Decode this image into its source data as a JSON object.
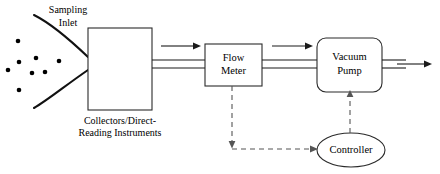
{
  "diagram": {
    "background_color": "#ffffff",
    "line_color": "#1a1a1a",
    "dashed_line_color": "#555555",
    "labels": {
      "sampling_inlet_line1": "Sampling",
      "sampling_inlet_line2": "Inlet",
      "collectors_line1": "Collectors/Direct-",
      "collectors_line2": "Reading Instruments",
      "flow_meter_line1": "Flow",
      "flow_meter_line2": "Meter",
      "vacuum_pump_line1": "Vacuum",
      "vacuum_pump_line2": "Pump",
      "controller": "Controller"
    },
    "nodes": [
      {
        "name": "collectors-box",
        "shape": "rectangle",
        "x": 88,
        "y": 28,
        "width": 64,
        "height": 82
      },
      {
        "name": "flow-meter-box",
        "shape": "rectangle",
        "x": 205,
        "y": 44,
        "width": 57,
        "height": 42
      },
      {
        "name": "vacuum-pump-box",
        "shape": "rounded-rectangle",
        "x": 317,
        "y": 38,
        "width": 65,
        "height": 54,
        "radius": 9
      },
      {
        "name": "controller-ellipse",
        "shape": "ellipse",
        "cx": 351,
        "cy": 150,
        "rx": 34,
        "ry": 17
      }
    ],
    "particles": [
      {
        "cx": 18,
        "cy": 41,
        "r": 2.3
      },
      {
        "cx": 19,
        "cy": 62,
        "r": 2.3
      },
      {
        "cx": 36,
        "cy": 58,
        "r": 2.3
      },
      {
        "cx": 59,
        "cy": 61,
        "r": 2.3
      },
      {
        "cx": 32,
        "cy": 73,
        "r": 2.3
      },
      {
        "cx": 45,
        "cy": 72,
        "r": 2.3
      },
      {
        "cx": 19,
        "cy": 90,
        "r": 2.3
      },
      {
        "cx": 8,
        "cy": 70,
        "r": 2.3
      }
    ],
    "connections": [
      {
        "name": "tube-collectors-to-flowmeter",
        "style": "double-line",
        "from": "collectors-box",
        "to": "flow-meter-box"
      },
      {
        "name": "tube-flowmeter-to-pump",
        "style": "double-line",
        "from": "flow-meter-box",
        "to": "vacuum-pump-box"
      },
      {
        "name": "tube-pump-outlet",
        "style": "double-line",
        "from": "vacuum-pump-box",
        "to": "exhaust"
      },
      {
        "name": "flow-arrow-1",
        "style": "solid-arrow",
        "direction": "right"
      },
      {
        "name": "flow-arrow-2",
        "style": "solid-arrow",
        "direction": "right"
      },
      {
        "name": "exhaust-arrow",
        "style": "solid-arrow",
        "direction": "right"
      },
      {
        "name": "signal-flowmeter-to-controller",
        "style": "dashed-arrow",
        "from": "flow-meter-box",
        "to": "controller-ellipse"
      },
      {
        "name": "signal-controller-to-pump",
        "style": "dashed-arrow",
        "from": "controller-ellipse",
        "to": "vacuum-pump-box"
      }
    ]
  }
}
